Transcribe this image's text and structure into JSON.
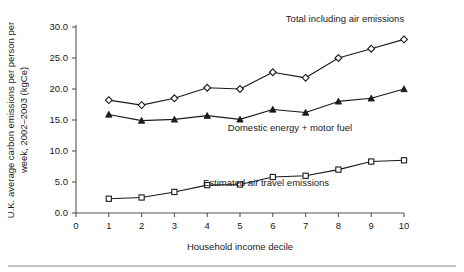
{
  "chart_data": {
    "type": "line",
    "title": "",
    "xlabel": "Household income decile",
    "ylabel": "U.K. average carbon emissions per person per week, 2002–2003 (kgCe)",
    "x": [
      1,
      2,
      3,
      4,
      5,
      6,
      7,
      8,
      9,
      10
    ],
    "categories": [
      "1",
      "2",
      "3",
      "4",
      "5",
      "6",
      "7",
      "8",
      "9",
      "10"
    ],
    "xlim": [
      0,
      10
    ],
    "ylim": [
      0.0,
      30.0
    ],
    "xticks": [
      "0",
      "1",
      "2",
      "3",
      "4",
      "5",
      "6",
      "7",
      "8",
      "9",
      "10"
    ],
    "yticks": [
      "0.0",
      "5.0",
      "10.0",
      "15.0",
      "20.0",
      "25.0",
      "30.0"
    ],
    "grid": false,
    "legend_position": "inline-annotations",
    "series": [
      {
        "name": "Total including air emissions",
        "marker": "open-diamond",
        "color": "#1a1a1a",
        "values": [
          18.2,
          17.4,
          18.5,
          20.2,
          20.0,
          22.7,
          21.8,
          25.0,
          26.5,
          28.0
        ]
      },
      {
        "name": "Domestic energy + motor fuel",
        "marker": "filled-triangle",
        "color": "#1a1a1a",
        "values": [
          15.9,
          14.9,
          15.1,
          15.7,
          15.1,
          16.7,
          16.2,
          18.0,
          18.5,
          20.0
        ]
      },
      {
        "name": "Estimated air travel emissions",
        "marker": "open-square",
        "color": "#1a1a1a",
        "values": [
          2.3,
          2.5,
          3.4,
          4.5,
          4.6,
          5.8,
          6.0,
          7.0,
          8.3,
          8.5
        ]
      }
    ],
    "annotations": [
      {
        "text": "Total including air emissions",
        "x": 345,
        "y": 22
      },
      {
        "text": "Domestic energy + motor fuel",
        "x": 290,
        "y": 131
      },
      {
        "text": "Estimated air travel emissions",
        "x": 266,
        "y": 186
      }
    ]
  },
  "ylabel_lines": [
    "U.K. average carbon emissions per person per",
    "week, 2002–2003 (kgCe)"
  ]
}
